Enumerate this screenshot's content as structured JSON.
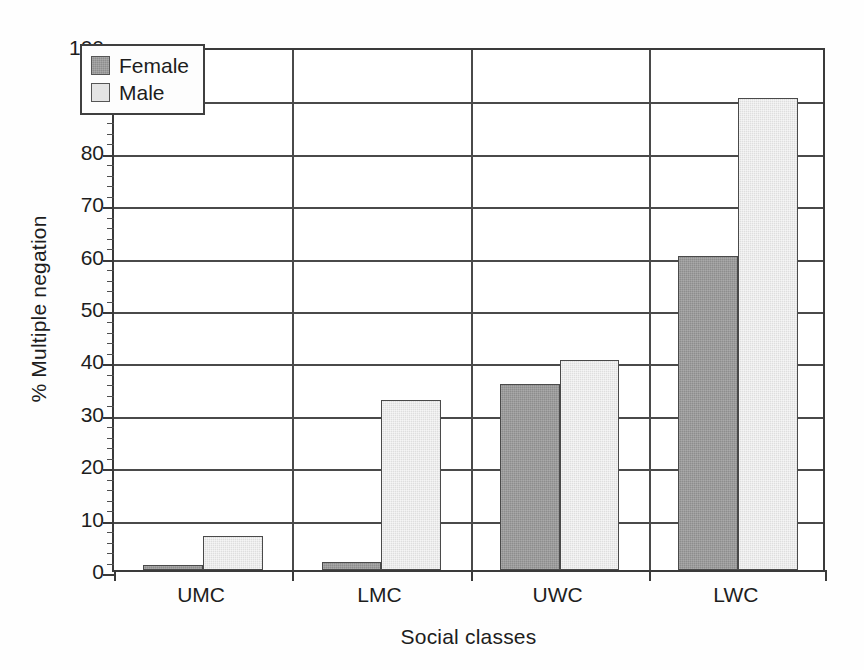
{
  "chart_data": {
    "type": "bar",
    "title": "",
    "subtitle": "",
    "xlabel": "Social classes",
    "ylabel": "% Multiple negation",
    "categories": [
      "UMC",
      "LMC",
      "UWC",
      "LWC"
    ],
    "series": [
      {
        "name": "Female",
        "color": "#8d8d8d",
        "values": [
          1,
          1.5,
          35.5,
          60
        ]
      },
      {
        "name": "Male",
        "color": "#dedede",
        "values": [
          6.5,
          32.5,
          40,
          90
        ]
      }
    ],
    "ylim": [
      0,
      100
    ],
    "ytick_labels": [
      "0",
      "10",
      "20",
      "30",
      "40",
      "50",
      "60",
      "70",
      "80",
      "90",
      "100"
    ],
    "ytick_values": [
      0,
      10,
      20,
      30,
      40,
      50,
      60,
      70,
      80,
      90,
      100
    ],
    "yminor_step": 2,
    "grid": "horizontal-major-and-category-separators",
    "legend_position": "upper-left-inside",
    "legend_entries": [
      "Female",
      "Male"
    ]
  }
}
